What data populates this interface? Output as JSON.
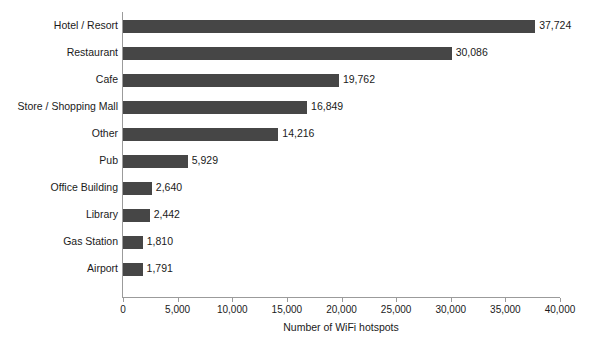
{
  "chart_data": {
    "type": "bar",
    "orientation": "horizontal",
    "title": "",
    "xlabel": "Number of WiFi hotspots",
    "ylabel": "",
    "categories": [
      "Hotel / Resort",
      "Restaurant",
      "Cafe",
      "Store / Shopping Mall",
      "Other",
      "Pub",
      "Office Building",
      "Library",
      "Gas Station",
      "Airport"
    ],
    "values": [
      37724,
      30086,
      19762,
      16849,
      14216,
      5929,
      2640,
      2442,
      1810,
      1791
    ],
    "value_labels": [
      "37,724",
      "30,086",
      "19,762",
      "16,849",
      "14,216",
      "5,929",
      "2,640",
      "2,442",
      "1,810",
      "1,791"
    ],
    "xlim": [
      0,
      40000
    ],
    "xticks": [
      0,
      5000,
      10000,
      15000,
      20000,
      25000,
      30000,
      35000,
      40000
    ],
    "xtick_labels": [
      "0",
      "5,000",
      "10,000",
      "15,000",
      "20,000",
      "25,000",
      "30,000",
      "35,000",
      "40,000"
    ],
    "grid": false,
    "legend": false,
    "bar_color": "#464646",
    "axis_color": "#9b9b9b",
    "background_color": "#ffffff"
  }
}
